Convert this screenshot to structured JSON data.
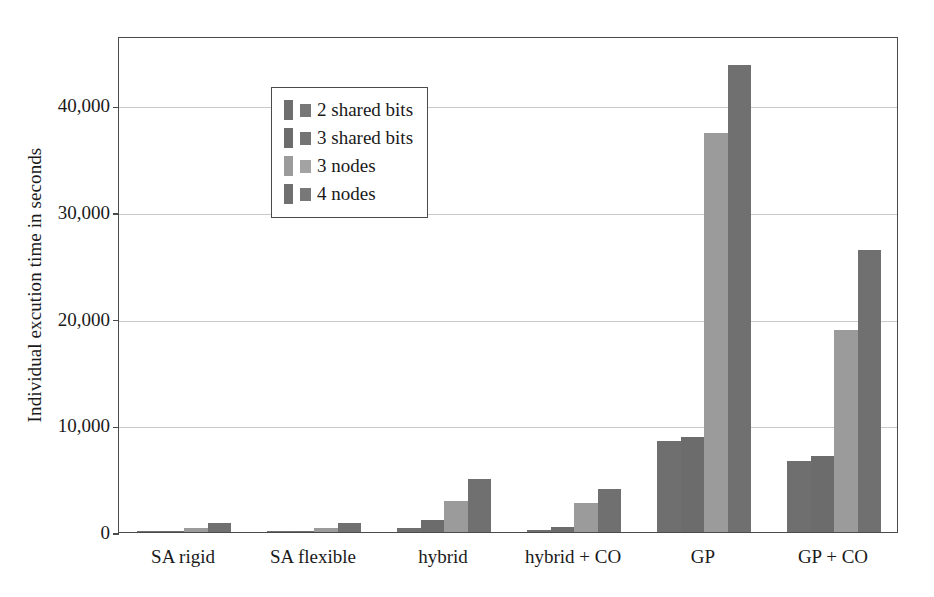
{
  "chart_data": {
    "type": "bar",
    "title": "",
    "subtitle": "",
    "xlabel": "",
    "ylabel": "Individual excution time in seconds",
    "categories": [
      "SA rigid",
      "SA flexible",
      "hybrid",
      "hybrid + CO",
      "GP",
      "GP + CO"
    ],
    "series": [
      {
        "name": "2 shared bits",
        "color": "#6f6f6f",
        "values": [
          50,
          50,
          350,
          150,
          8500,
          6700
        ]
      },
      {
        "name": "3 shared bits",
        "color": "#6c6c6c",
        "values": [
          120,
          110,
          1100,
          500,
          8900,
          7100
        ]
      },
      {
        "name": "3 nodes",
        "color": "#9b9b9b",
        "values": [
          390,
          400,
          2900,
          2750,
          37400,
          18900
        ]
      },
      {
        "name": "4 nodes",
        "color": "#707070",
        "values": [
          860,
          810,
          5000,
          4000,
          43800,
          26400
        ]
      }
    ],
    "ylim": [
      0,
      46500
    ],
    "yticks": [
      0,
      10000,
      20000,
      30000,
      40000
    ],
    "ytick_labels": [
      "0",
      "10,000",
      "20,000",
      "30,000",
      "40,000"
    ],
    "grid": true,
    "grid_axis": "y",
    "legend_position": "upper left",
    "bar_group_count": 6,
    "bars_per_group": 4
  },
  "axes": {
    "y_title": "Individual excution time in seconds",
    "y_tick_labels": [
      "0",
      "10,000",
      "20,000",
      "30,000",
      "40,000"
    ],
    "x_tick_labels": [
      "SA rigid",
      "SA flexible",
      "hybrid",
      "hybrid + CO",
      "GP",
      "GP + CO"
    ]
  },
  "legend": {
    "items": [
      {
        "label": "2 shared bits",
        "swatch_a": "#6f6f6f",
        "swatch_b": "#777777"
      },
      {
        "label": "3 shared bits",
        "swatch_a": "#6c6c6c",
        "swatch_b": "#747474"
      },
      {
        "label": "3 nodes",
        "swatch_a": "#9b9b9b",
        "swatch_b": "#a3a3a3"
      },
      {
        "label": "4 nodes",
        "swatch_a": "#707070",
        "swatch_b": "#787878"
      }
    ]
  },
  "style": {
    "frame_color": "#4a4a4a",
    "grid_color": "#c9c9c9",
    "background": "#ffffff",
    "text_color": "#1a1a1a"
  }
}
